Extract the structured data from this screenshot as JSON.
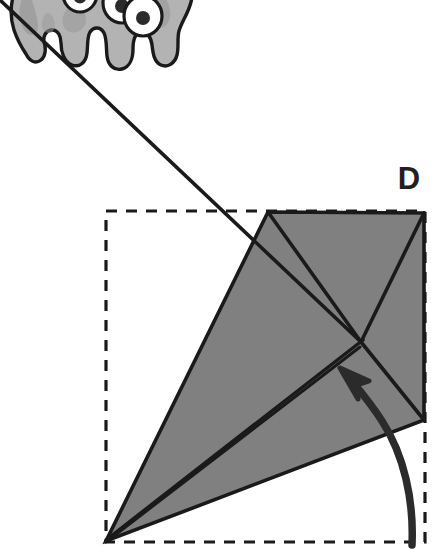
{
  "figure": {
    "step_label": "D",
    "type": "origami-instruction-diagram",
    "background_color": "#ffffff"
  },
  "mascot": {
    "name": "gray-monster-mascot",
    "description": "Cartoon blob monster with three eyes and four wavy legs, cropped by the top edge of the image",
    "body_color": "#b3b3b3",
    "shade_color": "#9a9a9a",
    "outline_color": "#1a1a1a",
    "eye_white": "#ffffff",
    "pupil_color": "#2b2b2b",
    "eye_count": 3,
    "leg_count": 4
  },
  "diagram": {
    "dashed_boundary": {
      "name": "paper-outline-square",
      "color": "#1a1a1a",
      "style": "dashed",
      "left": 106,
      "top": 211,
      "right": 425,
      "bottom": 542
    },
    "paper": {
      "fill_color": "#808080",
      "stroke_color": "#1a1a1a",
      "vertices": {
        "top": "268,212",
        "top_right": "424,213",
        "bottom_right": "424,420",
        "left_point": "106,541",
        "center": "361,342"
      }
    },
    "crease_lines": [
      {
        "name": "crease-top-to-center",
        "from": "268,212",
        "to": "361,342"
      },
      {
        "name": "crease-topright-to-center",
        "from": "424,213",
        "to": "361,342"
      },
      {
        "name": "crease-center-to-leftpoint",
        "from": "361,342",
        "to": "106,541"
      },
      {
        "name": "crease-center-to-bottomright",
        "from": "361,342",
        "to": "424,420"
      },
      {
        "name": "edge-bottomright-to-leftpoint",
        "from": "424,420",
        "to": "106,541"
      }
    ],
    "arrow": {
      "name": "fold-direction-arrow",
      "color": "#2b2b2b",
      "description": "Curved arrow sweeping up from lower right and pointing up-left toward the center crease",
      "tail": "412,543",
      "head": "344,372"
    }
  }
}
